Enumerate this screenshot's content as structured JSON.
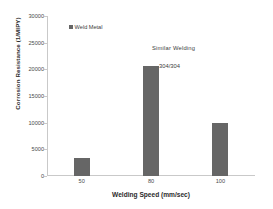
{
  "chart_data": {
    "type": "bar",
    "title": "",
    "categories": [
      "50",
      "80",
      "100"
    ],
    "values": [
      3300,
      20700,
      10000
    ],
    "series": [
      {
        "name": "Weld Metal",
        "values": [
          3300,
          20700,
          10000
        ]
      }
    ],
    "xlabel": "Welding Speed (mm/sec)",
    "ylabel": "Corrosion Resistance (1/MIPY)",
    "ylim": [
      0,
      30000
    ],
    "yticks": [
      0,
      5000,
      10000,
      15000,
      20000,
      25000,
      30000
    ],
    "ytick_labels": [
      "0",
      "5000",
      "10000",
      "15000",
      "20000",
      "25000",
      "30000"
    ],
    "xtick_labels": [
      "50",
      "80",
      "100"
    ],
    "grid": false,
    "legend": {
      "position": "upper-left-inside",
      "entries": [
        {
          "label": "Weld Metal",
          "color": "#666666",
          "marker": "square"
        }
      ]
    },
    "annotations": [
      {
        "text": "Similar  Welding",
        "x": 100,
        "y": 23500
      },
      {
        "text": "304/304",
        "x": 100,
        "y": 20200
      }
    ],
    "bar_color": "#666666",
    "axis_color": "#c9c9c9",
    "background": "#ffffff"
  }
}
